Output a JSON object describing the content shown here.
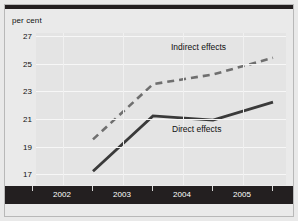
{
  "figure": {
    "y_axis_title": "per cent"
  },
  "chart_data": {
    "type": "line",
    "title": "",
    "subtitle": "",
    "xlabel": "",
    "ylabel": "per cent",
    "categories": [
      "2002",
      "2003",
      "2004",
      "2005"
    ],
    "x": [
      2002,
      2003,
      2004,
      2005
    ],
    "ylim": [
      16,
      27
    ],
    "yticks": [
      17,
      19,
      21,
      23,
      25,
      27
    ],
    "ytick_labels": [
      "17",
      "19",
      "21",
      "23",
      "25",
      "27"
    ],
    "xtick_labels": [
      "2002",
      "2003",
      "2004",
      "2005"
    ],
    "grid": "horizontal",
    "legend_position": "inline-annotation",
    "series": [
      {
        "name": "Indirect effects",
        "style": "dashed",
        "color": "#6f6f6f",
        "values": [
          19.3,
          23.3,
          24.0,
          25.2
        ]
      },
      {
        "name": "Direct effects",
        "style": "solid",
        "color": "#3a3a3a",
        "values": [
          17.0,
          21.0,
          20.7,
          22.0
        ]
      }
    ],
    "annotations": [
      {
        "text": "Indirect effects",
        "series": "Indirect effects"
      },
      {
        "text": "Direct effects",
        "series": "Direct effects"
      }
    ]
  },
  "colors": {
    "background": "#e9e9e9",
    "plot_background": "#e4e4e4",
    "axis_band": "#231f20",
    "gridline": "#f7f7f7",
    "indirect": "#6f6f6f",
    "direct": "#3a3a3a",
    "text": "#111111",
    "axis_text": "#ffffff"
  }
}
